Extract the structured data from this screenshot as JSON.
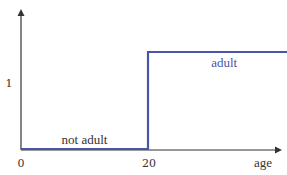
{
  "chart_data": {
    "type": "line",
    "title": "",
    "xlabel": "age",
    "ylabel": "",
    "x_ticks": [
      {
        "value": 0,
        "label": "0"
      },
      {
        "value": 20,
        "label": "20"
      }
    ],
    "y_ticks": [
      {
        "value": 1,
        "label": "1"
      }
    ],
    "xlim": [
      0,
      45
    ],
    "ylim": [
      0,
      1.2
    ],
    "series": [
      {
        "name": "adult indicator",
        "color": "#4a55a8",
        "points": [
          [
            0,
            0
          ],
          [
            20,
            0
          ],
          [
            20,
            1
          ],
          [
            44,
            1
          ]
        ]
      }
    ],
    "annotations": [
      {
        "text": "not adult",
        "x": 10,
        "y": 0,
        "color": "#333333"
      },
      {
        "text": "adult",
        "x": 32,
        "y": 1,
        "color": "#4a55a8"
      }
    ],
    "grid": false,
    "axis_color": "#333333"
  }
}
